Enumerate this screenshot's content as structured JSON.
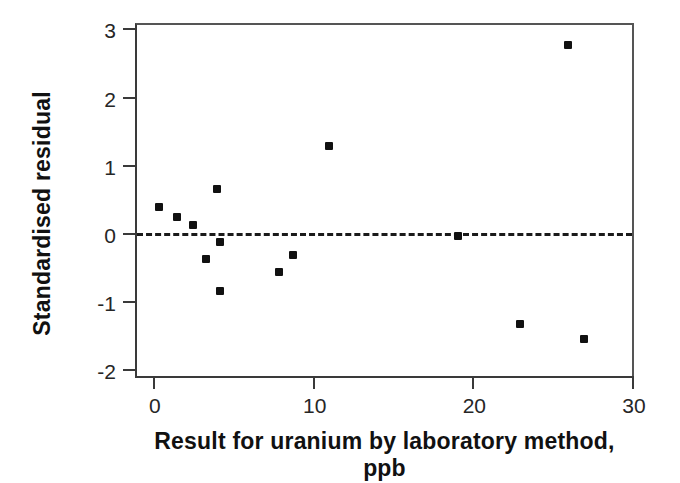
{
  "chart_data": {
    "type": "scatter",
    "title": "",
    "xlabel": "Result for uranium by laboratory method, ppb",
    "ylabel": "Standardised residual",
    "xlim": [
      -1.0,
      30.0
    ],
    "ylim": [
      -2.1,
      3.05
    ],
    "xticks": [
      0,
      10,
      20,
      30
    ],
    "xtick_labels": [
      "0",
      "10",
      "20",
      "30"
    ],
    "yticks": [
      -2,
      -1,
      0,
      1,
      2,
      3
    ],
    "ytick_labels": [
      "-2",
      "-1",
      "0",
      "1",
      "2",
      "3"
    ],
    "grid": false,
    "legend": false,
    "marker": "filled-square",
    "marker_color": "#111111",
    "reference_line": {
      "orientation": "horizontal",
      "y": 0,
      "style": "dashed",
      "color": "#1a1a1a"
    },
    "series": [
      {
        "name": "Standardised residual",
        "points": [
          {
            "x": 0.4,
            "y": 0.38
          },
          {
            "x": 1.5,
            "y": 0.24
          },
          {
            "x": 2.5,
            "y": 0.11
          },
          {
            "x": 3.3,
            "y": -0.38
          },
          {
            "x": 4.0,
            "y": 0.64
          },
          {
            "x": 4.2,
            "y": -0.14
          },
          {
            "x": 4.2,
            "y": -0.86
          },
          {
            "x": 7.9,
            "y": -0.58
          },
          {
            "x": 8.8,
            "y": -0.33
          },
          {
            "x": 11.0,
            "y": 1.27
          },
          {
            "x": 19.1,
            "y": -0.05
          },
          {
            "x": 23.0,
            "y": -1.34
          },
          {
            "x": 26.0,
            "y": 2.75
          },
          {
            "x": 27.0,
            "y": -1.56
          }
        ]
      }
    ]
  },
  "axes": {
    "x_label": "Result for uranium by laboratory method, ppb",
    "y_label": "Standardised residual"
  }
}
